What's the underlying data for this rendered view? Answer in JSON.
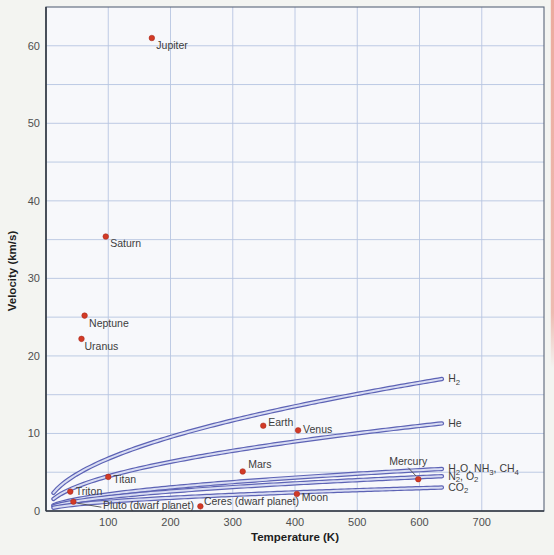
{
  "figure": {
    "background_color": "#f3f4f1",
    "plot_background_color": "#f7f8fb",
    "page_edge_strip_color": "#eca295"
  },
  "chart_data": {
    "type": "scatter",
    "title": "",
    "xlabel": "Temperature (K)",
    "ylabel": "Velocity (km/s)",
    "xlim": [
      0,
      800
    ],
    "ylim": [
      0,
      65
    ],
    "x_ticks": [
      100,
      200,
      300,
      400,
      500,
      600,
      700
    ],
    "y_ticks": [
      0,
      10,
      20,
      30,
      40,
      50,
      60
    ],
    "grid": {
      "x_step": 100,
      "y_step": 5,
      "on": true,
      "color": "#b7c5e1"
    },
    "style": {
      "frame_color": "#5a6579",
      "axis_color": "#333a44",
      "point_color": "#d23a26",
      "point_radius": 2.8,
      "curve_outer_color": "#5d63b5",
      "curve_inner_color": "#d9ddf3",
      "label_color": "#3d3d3d",
      "tick_color": "#4f4f4f"
    },
    "points": [
      {
        "name": "Jupiter",
        "label": "Jupiter",
        "temperature_K": 170,
        "velocity_kms": 61.0,
        "label_dx": 4.5,
        "label_dy": 10.5
      },
      {
        "name": "Saturn",
        "label": "Saturn",
        "temperature_K": 96,
        "velocity_kms": 35.4,
        "label_dx": 4.5,
        "label_dy": 10.8
      },
      {
        "name": "Neptune",
        "label": "Neptune",
        "temperature_K": 62,
        "velocity_kms": 25.2,
        "label_dx": 4.5,
        "label_dy": 11.5
      },
      {
        "name": "Uranus",
        "label": "Uranus",
        "temperature_K": 57,
        "velocity_kms": 22.2,
        "label_dx": 3.0,
        "label_dy": 11.0
      },
      {
        "name": "Earth",
        "label": "Earth",
        "temperature_K": 349,
        "velocity_kms": 11.0,
        "label_dx": 5.0,
        "label_dy": 0.5
      },
      {
        "name": "Venus",
        "label": "Venus",
        "temperature_K": 405,
        "velocity_kms": 10.4,
        "label_dx": 5.0,
        "label_dy": 2.5
      },
      {
        "name": "Mars",
        "label": "Mars",
        "temperature_K": 316,
        "velocity_kms": 5.1,
        "label_dx": 5.5,
        "label_dy": -3.0
      },
      {
        "name": "Mercury",
        "label": "Mercury",
        "temperature_K": 598,
        "velocity_kms": 4.1,
        "label_dx": -29.0,
        "label_dy": -14.0,
        "leader": [
          -10.0,
          -11.5,
          -2.0,
          -3.0
        ]
      },
      {
        "name": "Moon",
        "label": "Moon",
        "temperature_K": 403,
        "velocity_kms": 2.2,
        "label_dx": 5.0,
        "label_dy": 7.5
      },
      {
        "name": "Ceres",
        "label": "Ceres (dwarf planet)",
        "temperature_K": 248,
        "velocity_kms": 0.6,
        "label_dx": 3.5,
        "label_dy": -1.5
      },
      {
        "name": "Pluto",
        "label": "Pluto (dwarf planet)",
        "temperature_K": 44,
        "velocity_kms": 1.2,
        "label_dx": 29.5,
        "label_dy": 7.5,
        "leader": [
          4.0,
          1.5,
          28.0,
          5.5
        ]
      },
      {
        "name": "Triton",
        "label": "Triton",
        "temperature_K": 39,
        "velocity_kms": 2.5,
        "label_dx": 5.5,
        "label_dy": 3.5
      },
      {
        "name": "Titan",
        "label": "Titan",
        "temperature_K": 100,
        "velocity_kms": 4.4,
        "label_dx": 5.0,
        "label_dy": 6.5
      }
    ],
    "curves": [
      {
        "id": "h2",
        "label": "H_2_",
        "k": 0.675,
        "t_start": 12,
        "t_end": 638,
        "note": "v = k*sqrt(T); ends ~17 km/s at 638 K"
      },
      {
        "id": "he",
        "label": "He",
        "k": 0.448,
        "t_start": 12,
        "t_end": 638,
        "note": "ends ~11.3 km/s at 638 K"
      },
      {
        "id": "h2o-nh3-ch4",
        "label": "H_2_O, NH_3_, CH_4_",
        "k": 0.215,
        "t_start": 12,
        "t_end": 638,
        "note": "ends ~5.4 km/s at 638 K"
      },
      {
        "id": "n2-o2",
        "label": "N_2_, O_2_",
        "k": 0.178,
        "t_start": 12,
        "t_end": 638,
        "note": "ends ~4.5 km/s at 638 K"
      },
      {
        "id": "co2",
        "label": "CO_2_",
        "k": 0.12,
        "t_start": 12,
        "t_end": 638,
        "note": "ends ~3.0 km/s at 638 K"
      }
    ],
    "legend_position": "curve-end-labels-right",
    "plot_box_px": {
      "left": 46,
      "top": 7,
      "right": 544,
      "bottom": 511
    }
  }
}
